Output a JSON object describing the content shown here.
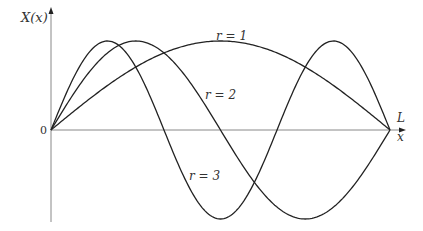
{
  "diagram": {
    "y_axis_label": "X(x)",
    "x_axis_label": "x",
    "origin_label": "0",
    "endpoint_label": "L",
    "curve_labels": {
      "r1": "r = 1",
      "r2": "r = 2",
      "r3": "r = 3"
    }
  },
  "chart_data": {
    "type": "line",
    "title": "",
    "xlabel": "x",
    "ylabel": "X(x)",
    "xlim": [
      0,
      "L"
    ],
    "function": "X_r(x) = sin(r*pi*x/L)",
    "series": [
      {
        "name": "r = 1",
        "r": 1,
        "peaks_at": [
          0.5
        ],
        "zeros_at": [
          0,
          1
        ]
      },
      {
        "name": "r = 2",
        "r": 2,
        "peaks_at": [
          0.25
        ],
        "troughs_at": [
          0.75
        ],
        "zeros_at": [
          0,
          0.5,
          1
        ]
      },
      {
        "name": "r = 3",
        "r": 3,
        "peaks_at": [
          0.1667,
          0.8333
        ],
        "troughs_at": [
          0.5
        ],
        "zeros_at": [
          0,
          0.3333,
          0.6667,
          1
        ]
      }
    ],
    "grid": false,
    "legend": "inline labels"
  },
  "colors": {
    "axis": "#777777",
    "curve": "#222222",
    "text": "#333333"
  }
}
